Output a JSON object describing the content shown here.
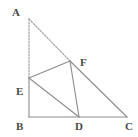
{
  "figure": {
    "type": "geometry-diagram",
    "width": 138,
    "height": 137,
    "background_color": "#ffffff",
    "stroke_color": "#8c8c8c",
    "dashed_stroke_color": "#a8a8a8",
    "label_color": "#4a4a4a",
    "points": [
      {
        "name": "A",
        "x": 29,
        "y": 19,
        "label": "A",
        "label_x": 12,
        "label_y": 7
      },
      {
        "name": "B",
        "x": 29,
        "y": 117,
        "label": "B",
        "label_x": 16,
        "label_y": 121
      },
      {
        "name": "C",
        "x": 127,
        "y": 117,
        "label": "C",
        "label_x": 125,
        "label_y": 121
      },
      {
        "name": "D",
        "x": 79,
        "y": 117,
        "label": "D",
        "label_x": 75,
        "label_y": 121
      },
      {
        "name": "E",
        "x": 29,
        "y": 78,
        "label": "E",
        "label_x": 16,
        "label_y": 86
      },
      {
        "name": "F",
        "x": 70,
        "y": 61,
        "label": "F",
        "label_x": 80,
        "label_y": 57
      }
    ],
    "segments": [
      {
        "name": "segment-AB",
        "from": "A",
        "to": "E",
        "style": "dashed"
      },
      {
        "name": "segment-AF",
        "from": "A",
        "to": "F",
        "style": "dashed"
      },
      {
        "name": "segment-EB",
        "from": "E",
        "to": "B",
        "style": "solid"
      },
      {
        "name": "segment-BC",
        "from": "B",
        "to": "C",
        "style": "solid"
      },
      {
        "name": "segment-EF",
        "from": "E",
        "to": "F",
        "style": "solid"
      },
      {
        "name": "segment-ED",
        "from": "E",
        "to": "D",
        "style": "solid"
      },
      {
        "name": "segment-FD",
        "from": "F",
        "to": "D",
        "style": "solid"
      },
      {
        "name": "segment-FC",
        "from": "F",
        "to": "C",
        "style": "solid"
      }
    ]
  }
}
